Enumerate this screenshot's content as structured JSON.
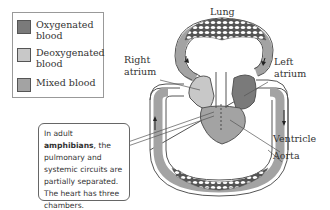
{
  "legend": {
    "items": [
      {
        "label": "Oxygenated blood",
        "line1": "Oxygenated",
        "line2": "blood",
        "color": "#7a7a7a"
      },
      {
        "label": "Deoxygenated blood",
        "line1": "Deoxygenated",
        "line2": "blood",
        "color": "#c8c8c8"
      },
      {
        "label": "Mixed blood",
        "line1": "Mixed blood",
        "line2": "",
        "color": "#a3a3a3"
      }
    ]
  },
  "labels": {
    "lung": "Lung",
    "right_atrium_1": "Right",
    "right_atrium_2": "atrium",
    "left_atrium_1": "Left",
    "left_atrium_2": "atrium",
    "ventricle": "Ventricle",
    "aorta": "Aorta"
  },
  "callout": {
    "pre": "In adult ",
    "bold": "amphibians",
    "post": ", the pulmonary and systemic circuits are partially separated. The heart has three chambers."
  },
  "colors": {
    "oxygenated": "#7a7a7a",
    "deoxygenated": "#c8c8c8",
    "mixed": "#a3a3a3",
    "outline": "#555555"
  }
}
